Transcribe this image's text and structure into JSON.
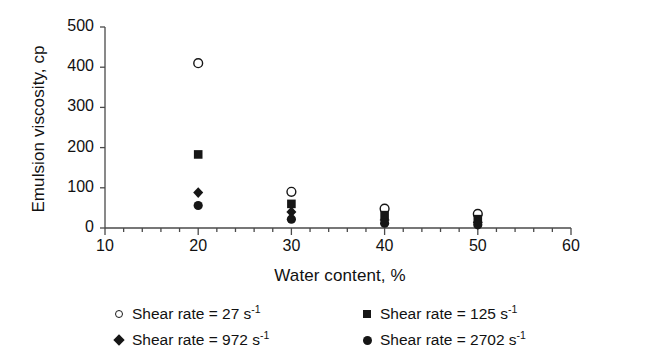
{
  "chart_data": {
    "type": "scatter",
    "title": "",
    "xlabel": "Water content, %",
    "ylabel": "Emulsion viscosity, cp",
    "xlim": [
      10,
      60
    ],
    "ylim": [
      0,
      500
    ],
    "xticks": [
      10,
      20,
      30,
      40,
      50,
      60
    ],
    "xtick_labels": [
      "10",
      "20",
      "30",
      "40",
      "50",
      "60"
    ],
    "yticks": [
      0,
      100,
      200,
      300,
      400,
      500
    ],
    "ytick_labels": [
      "0",
      "100",
      "200",
      "300",
      "400",
      "500"
    ],
    "x_minor_tick_step": 2,
    "grid": false,
    "legend_position": "below",
    "x": [
      20,
      30,
      40,
      50
    ],
    "series": [
      {
        "name": "Shear rate = 27 s-1",
        "label_prefix": "Shear rate = 27 s",
        "label_sup": "-1",
        "marker": "circle-open",
        "color": "#161616",
        "values": [
          410,
          90,
          48,
          35
        ]
      },
      {
        "name": "Shear rate = 125 s-1",
        "label_prefix": "Shear rate = 125 s",
        "label_sup": "-1",
        "marker": "square-filled",
        "color": "#161616",
        "values": [
          183,
          60,
          32,
          22
        ]
      },
      {
        "name": "Shear rate = 972 s-1",
        "label_prefix": "Shear rate = 972 s",
        "label_sup": "-1",
        "marker": "diamond-filled",
        "color": "#161616",
        "values": [
          88,
          40,
          20,
          14
        ]
      },
      {
        "name": "Shear rate = 2702 s-1",
        "label_prefix": "Shear rate = 2702 s",
        "label_sup": "-1",
        "marker": "circle-filled",
        "color": "#161616",
        "values": [
          56,
          22,
          12,
          8
        ]
      }
    ]
  },
  "axis": {
    "y_title": "Emulsion viscosity, cp",
    "x_title": "Water content, %"
  },
  "colors": {
    "ink": "#161616",
    "axis": "#4a4a4a",
    "background": "#ffffff"
  }
}
